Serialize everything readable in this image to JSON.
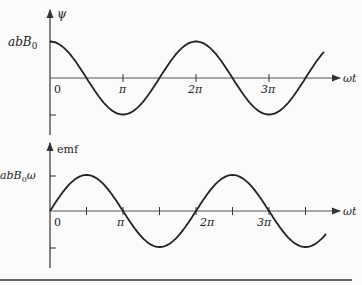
{
  "chart_data": [
    {
      "type": "line",
      "title": "",
      "ylabel": "ψ",
      "xlabel": "ωt",
      "y_tick_labels": [
        "abB0"
      ],
      "x_tick_labels": [
        "0",
        "π",
        "2π",
        "3π"
      ],
      "function": "abB0·cos(ωt)",
      "x": [
        0,
        0.5,
        1,
        1.5,
        2,
        2.5,
        3,
        3.5
      ],
      "x_unit": "π",
      "values": [
        1,
        0,
        -1,
        0,
        1,
        0,
        -1,
        0
      ],
      "ylim": [
        -1,
        1
      ],
      "grid": false
    },
    {
      "type": "line",
      "title": "",
      "ylabel": "emf",
      "xlabel": "ωt",
      "y_tick_labels": [
        "abB0ω"
      ],
      "x_tick_labels": [
        "0",
        "π",
        "2π",
        "3π"
      ],
      "function": "abB0ω·sin(ωt)",
      "x": [
        0,
        0.5,
        1,
        1.5,
        2,
        2.5,
        3,
        3.5
      ],
      "x_unit": "π",
      "values": [
        0,
        1,
        0,
        -1,
        0,
        1,
        0,
        -1
      ],
      "ylim": [
        -1,
        1
      ],
      "grid": false
    }
  ],
  "top": {
    "ylabel": "ψ",
    "amp_label_main": "abB",
    "amp_label_sub": "0",
    "x_origin": "0",
    "ticks": [
      "π",
      "2π",
      "3π"
    ],
    "xlabel": "ωt"
  },
  "bottom": {
    "ylabel": "emf",
    "amp_label_main": "abB",
    "amp_label_sub": "0",
    "amp_label_suffix": "ω",
    "x_origin": "0",
    "ticks": [
      "π",
      "2π",
      "3π"
    ],
    "xlabel": "ωt"
  }
}
